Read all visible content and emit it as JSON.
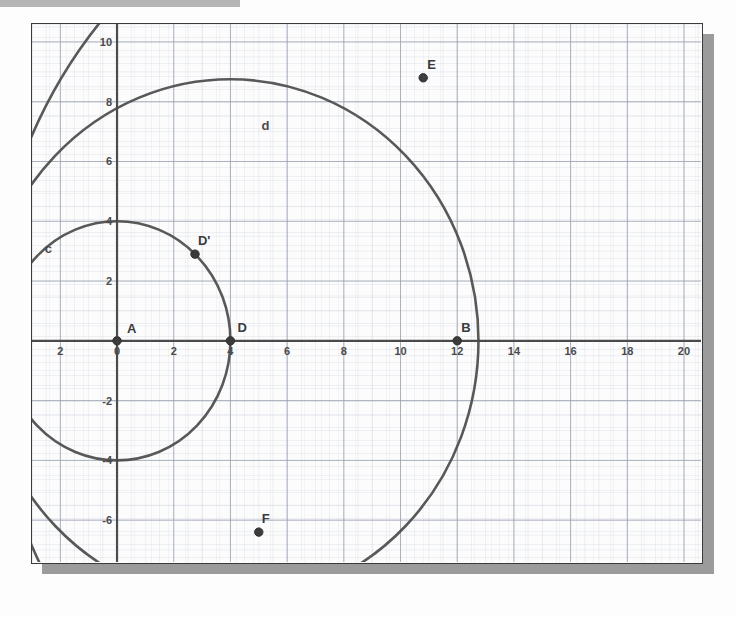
{
  "document": {
    "kind": "scanned-geometry-figure",
    "top_bar_present": true
  },
  "plot": {
    "frame_color": "#3a3a3a",
    "background_color": "#fcfcfd",
    "shadow_color": "#8a8a8a",
    "grid_major_color": "#9aa2b0",
    "grid_minor_color": "#c9ced8",
    "curve_color": "#4a4a4a",
    "axis_color": "#4a4a4a"
  },
  "chart_data": {
    "type": "scatter",
    "title": "",
    "xlabel": "",
    "ylabel": "",
    "xlim": [
      -3,
      20.6
    ],
    "ylim": [
      -7.4,
      10.6
    ],
    "grid": true,
    "legend": "none",
    "xticks": [
      -2,
      0,
      2,
      4,
      6,
      8,
      10,
      12,
      14,
      16,
      18,
      20
    ],
    "xticklabels": [
      "2",
      "0",
      "2",
      "4",
      "6",
      "8",
      "10",
      "12",
      "14",
      "16",
      "18",
      "20"
    ],
    "yticks": [
      10,
      8,
      6,
      4,
      2,
      0,
      -2,
      -4,
      -6
    ],
    "yticklabels": [
      "10",
      "8",
      "6",
      "4",
      "2",
      "0",
      "-2",
      "-4",
      "-6"
    ],
    "points": [
      {
        "name": "A",
        "x": 0,
        "y": 0,
        "label": "A",
        "label_dx": 10,
        "label_dy": -8
      },
      {
        "name": "B",
        "x": 12,
        "y": 0,
        "label": "B",
        "label_dx": 4,
        "label_dy": -9
      },
      {
        "name": "D",
        "x": 4,
        "y": 0,
        "label": "D",
        "label_dx": 7,
        "label_dy": -9
      },
      {
        "name": "Dp",
        "x": 2.75,
        "y": 2.9,
        "label": "D'",
        "label_dx": 3,
        "label_dy": -9
      },
      {
        "name": "E",
        "x": 10.8,
        "y": 8.8,
        "label": "E",
        "label_dx": 4,
        "label_dy": -9
      },
      {
        "name": "F",
        "x": 5.0,
        "y": -6.4,
        "label": "F",
        "label_dx": 3,
        "label_dy": -9
      }
    ],
    "circles": [
      {
        "name": "c",
        "cx": 0,
        "cy": 0,
        "r": 4,
        "label": "c",
        "label_x": -2.55,
        "label_y": 2.95
      },
      {
        "name": "d",
        "cx": 4,
        "cy": 0,
        "r": 8.75,
        "label": "d",
        "label_x": 5.1,
        "label_y": 7.05
      },
      {
        "name": "e",
        "cx": 12,
        "cy": 0,
        "r": 16.5,
        "label": "",
        "label_x": 0,
        "label_y": 0
      }
    ]
  }
}
